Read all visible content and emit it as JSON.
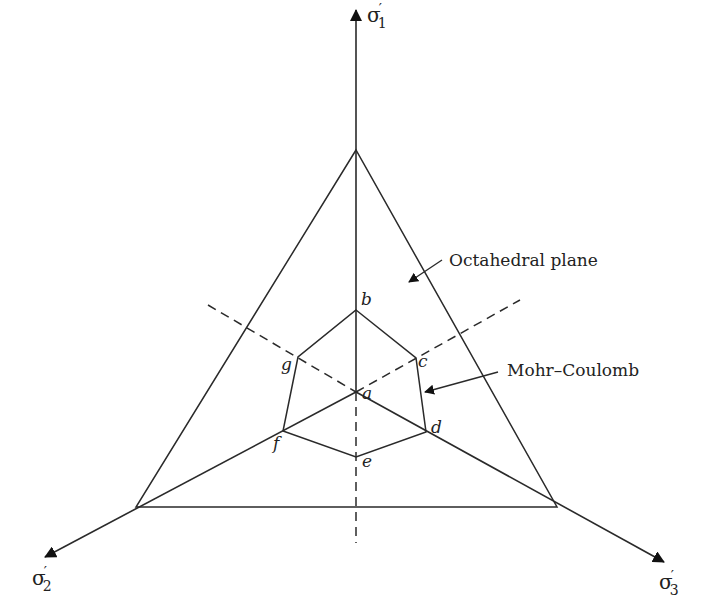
{
  "diagram": {
    "type": "octahedral-plane-mohr-coulomb",
    "axes": [
      {
        "id": "sigma1",
        "symbol": "σ",
        "prime": "′",
        "subscript": "1"
      },
      {
        "id": "sigma2",
        "symbol": "σ",
        "prime": "′",
        "subscript": "2"
      },
      {
        "id": "sigma3",
        "symbol": "σ",
        "prime": "′",
        "subscript": "3"
      }
    ],
    "points": {
      "a": "a",
      "b": "b",
      "c": "c",
      "d": "d",
      "e": "e",
      "f": "f",
      "g": "g"
    },
    "annotations": {
      "octahedral_plane": "Octahedral plane",
      "mohr_coulomb": "Mohr–Coulomb"
    },
    "colors": {
      "line": "#2a2a2a",
      "text": "#222222",
      "background": "#ffffff"
    }
  }
}
